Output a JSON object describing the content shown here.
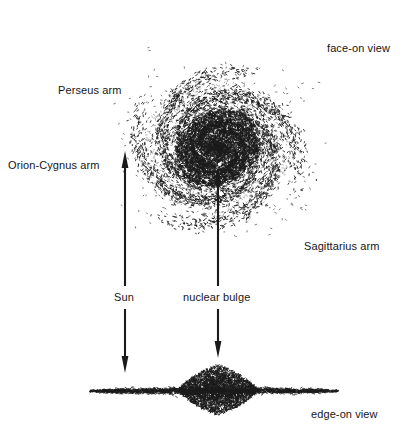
{
  "figure": {
    "background_color": "#ffffff",
    "ink_color": "#1a1a1a",
    "width": 413,
    "height": 429
  },
  "labels": {
    "face_on_view": "face-on view",
    "perseus_arm": "Perseus arm",
    "orion_cygnus_arm": "Orion-Cygnus arm",
    "sagittarius_arm": "Sagittarius arm",
    "sun": "Sun",
    "nuclear_bulge": "nuclear bulge",
    "edge_on_view": "edge-on view"
  },
  "diagram_data": {
    "type": "diagram",
    "views": [
      {
        "name": "face-on view",
        "center": [
          218,
          148
        ],
        "outer_radius": 128,
        "nucleus_radius": 34,
        "arm_count": 4,
        "arm_labels": [
          "Perseus arm",
          "Orion-Cygnus arm",
          "Sagittarius arm"
        ],
        "render": "stipple"
      },
      {
        "name": "edge-on view",
        "disk_span_x": [
          90,
          338
        ],
        "disk_y": 391,
        "disk_half_thickness": 3,
        "bulge_center": [
          218,
          390
        ],
        "bulge_half_width": 40,
        "bulge_half_height": 21,
        "render": "stipple"
      }
    ],
    "arrows": [
      {
        "name": "sun-up-arrow",
        "from": [
          125,
          286
        ],
        "to": [
          125,
          151
        ],
        "head": "top"
      },
      {
        "name": "nuclear-bulge-up-arrow",
        "from": [
          218,
          286
        ],
        "to": [
          218,
          166
        ],
        "head": "top"
      },
      {
        "name": "sun-down-arrow",
        "from": [
          125,
          309
        ],
        "to": [
          125,
          373
        ],
        "head": "bottom"
      },
      {
        "name": "nuclear-bulge-down-arrow",
        "from": [
          218,
          309
        ],
        "to": [
          218,
          358
        ],
        "head": "bottom"
      }
    ]
  }
}
